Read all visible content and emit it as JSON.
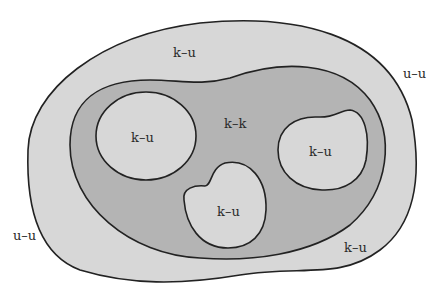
{
  "colors": {
    "background": "#ffffff",
    "outer_region": "#d7d7d7",
    "middle_region": "#b4b4b4",
    "inner_blobs": "#d7d7d7",
    "stroke": "#222222"
  },
  "labels": {
    "outer_top": "k–u",
    "outer_right": "u–u",
    "outer_left": "u–u",
    "outer_bottom_right": "k–u",
    "middle": "k–k",
    "blob_left": "k–u",
    "blob_right": "k–u",
    "blob_bottom": "k–u"
  }
}
